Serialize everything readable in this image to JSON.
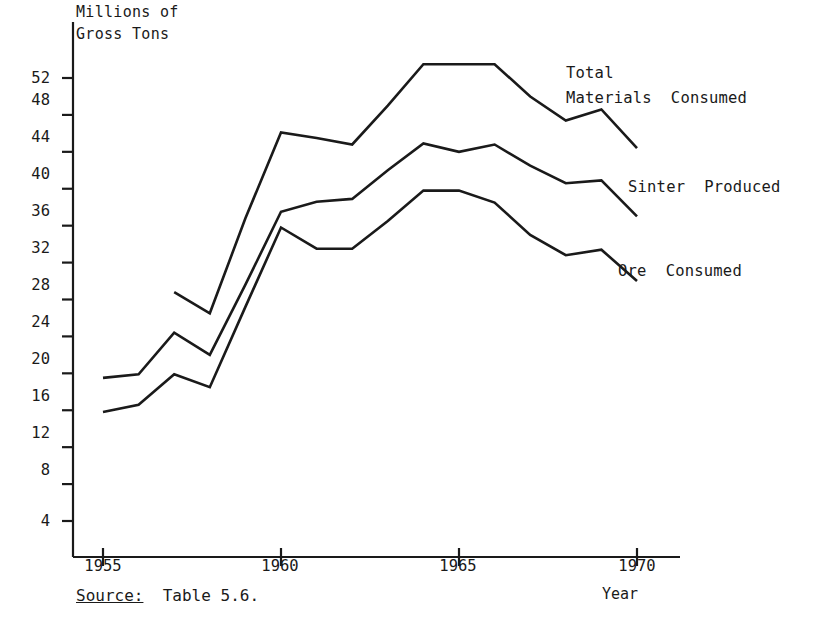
{
  "chart_data": {
    "type": "line",
    "title": "",
    "ylabel": "Millions of Gross Tons",
    "ylabel_line1": "Millions of",
    "ylabel_line2": "Gross Tons",
    "xlabel": "Year",
    "xlim": [
      1954.2,
      1970.8
    ],
    "ylim": [
      0,
      55
    ],
    "grid": false,
    "legend_position": "inline-right",
    "yticks": [
      52,
      48,
      44,
      40,
      36,
      32,
      28,
      24,
      20,
      16,
      12,
      8,
      4
    ],
    "xticks": [
      1955,
      1960,
      1965,
      1970
    ],
    "xtick_labels": [
      "1955",
      "1960",
      "1965",
      "1970"
    ],
    "series": [
      {
        "name": "Total Materials Consumed",
        "label_line1": "Total",
        "label_line2": "Materials  Consumed",
        "x": [
          1957,
          1958,
          1959,
          1960,
          1961,
          1962,
          1963,
          1964,
          1965,
          1966,
          1967,
          1968,
          1969,
          1970
        ],
        "values": [
          28.8,
          26.5,
          36.8,
          46.1,
          45.5,
          44.8,
          49.0,
          53.5,
          53.5,
          53.5,
          50.0,
          47.4,
          48.6,
          44.4
        ]
      },
      {
        "name": "Sinter Produced",
        "label_line1": "Sinter  Produced",
        "x": [
          1955,
          1956,
          1957,
          1958,
          1959,
          1960,
          1961,
          1962,
          1963,
          1964,
          1965,
          1966,
          1967,
          1968,
          1969,
          1970
        ],
        "values": [
          19.5,
          19.9,
          24.4,
          22.0,
          29.6,
          37.5,
          38.6,
          38.9,
          42.0,
          44.9,
          44.0,
          44.8,
          42.5,
          40.6,
          40.9,
          37.0
        ]
      },
      {
        "name": "Ore Consumed",
        "label_line1": "Ore  Consumed",
        "x": [
          1955,
          1956,
          1957,
          1958,
          1959,
          1960,
          1961,
          1962,
          1963,
          1964,
          1965,
          1966,
          1967,
          1968,
          1969,
          1970
        ],
        "values": [
          15.8,
          16.6,
          19.9,
          18.5,
          27.2,
          35.8,
          33.5,
          33.5,
          36.5,
          39.8,
          39.8,
          38.5,
          35.0,
          32.8,
          33.4,
          30.0
        ]
      }
    ],
    "annotations": [
      {
        "name": "source-note",
        "prefix": "Source:",
        "text": "  Table 5.6."
      }
    ]
  },
  "source_note": {
    "label": "Source:",
    "value": "  Table 5.6."
  }
}
